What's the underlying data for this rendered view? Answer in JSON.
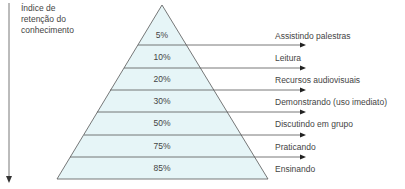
{
  "axis": {
    "label_lines": [
      "Índice de",
      "retenção do",
      "conhecimento"
    ],
    "direction": "down"
  },
  "pyramid": {
    "fill_color": "#e6f5f7",
    "line_color": "#555555",
    "levels": [
      {
        "percent": "5%",
        "method": "Assistindo palestras"
      },
      {
        "percent": "10%",
        "method": "Leitura"
      },
      {
        "percent": "20%",
        "method": "Recursos audiovisuais"
      },
      {
        "percent": "30%",
        "method": "Demonstrando (uso imediato)"
      },
      {
        "percent": "50%",
        "method": "Discutindo em grupo"
      },
      {
        "percent": "75%",
        "method": "Praticando"
      },
      {
        "percent": "85%",
        "method": "Ensinando"
      }
    ]
  }
}
